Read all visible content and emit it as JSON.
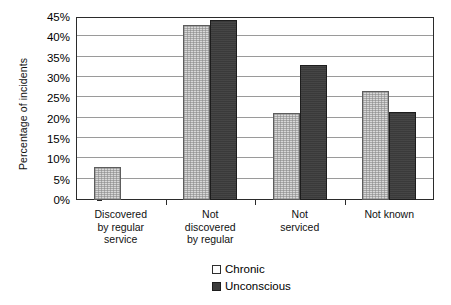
{
  "chart_data": {
    "type": "bar",
    "title": "",
    "xlabel": "",
    "ylabel": "Percentage of incidents",
    "ylim": [
      0,
      45
    ],
    "ytick_step": 5,
    "ytick_labels": [
      "0%",
      "5%",
      "10%",
      "15%",
      "20%",
      "25%",
      "30%",
      "35%",
      "40%",
      "45%"
    ],
    "ytick_values": [
      0,
      5,
      10,
      15,
      20,
      25,
      30,
      35,
      40,
      45
    ],
    "grid": true,
    "grid_axis": "y",
    "legend_position": "bottom",
    "categories": [
      "Discovered by regular service",
      "Not discovered by regular",
      "Not serviced",
      "Not known"
    ],
    "category_label_lines": [
      [
        "Discovered",
        "by regular",
        "service"
      ],
      [
        "Not",
        "discovered",
        "by regular"
      ],
      [
        "Not",
        "serviced"
      ],
      [
        "Not known"
      ]
    ],
    "series": [
      {
        "name": "Chronic",
        "color": "#d8d8d8",
        "values": [
          8.1,
          43.0,
          21.4,
          26.8
        ]
      },
      {
        "name": "Unconscious",
        "color": "#3a3a3a",
        "values": [
          0.0,
          44.3,
          33.2,
          21.6
        ]
      }
    ]
  },
  "legend": {
    "items": [
      {
        "label": "Chronic",
        "swatch": "light-swatch-icon"
      },
      {
        "label": "Unconscious",
        "swatch": "dark-swatch-icon"
      }
    ]
  },
  "axis": {
    "y_title": "Percentage of incidents"
  }
}
